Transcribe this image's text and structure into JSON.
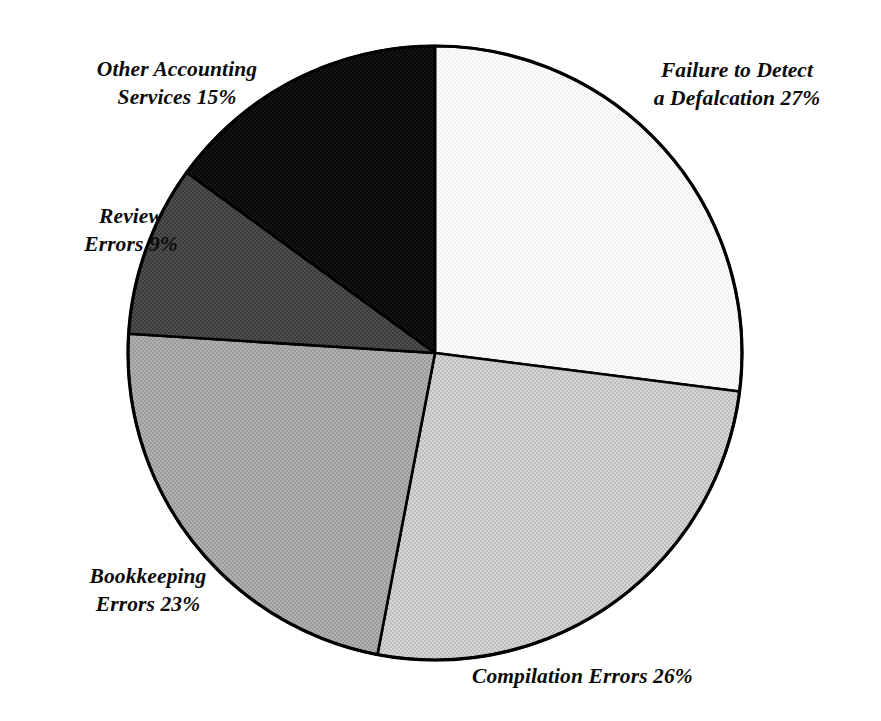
{
  "chart_data": {
    "type": "pie",
    "title": "",
    "subtitle": "",
    "xlabel": "",
    "ylabel": "",
    "legend_position": "none",
    "grid": false,
    "units": "percent",
    "start_angle_deg": 0,
    "direction": "clockwise",
    "center": {
      "x": 435,
      "y": 353
    },
    "radius": 307,
    "categories": [
      "Failure to Detect a Defalcation",
      "Compilation Errors",
      "Bookkeeping Errors",
      "Review Errors",
      "Other Accounting Services"
    ],
    "values": [
      27,
      26,
      23,
      9,
      15
    ],
    "slices": [
      {
        "name": "failure-to-detect-a-defalcation",
        "label_line1": "Failure to Detect",
        "label_line2": "a Defalcation 27%",
        "label_text": "Failure to Detect\na Defalcation 27%",
        "value": 27,
        "value_text": "27%",
        "fill": "#f7f7f7",
        "start_deg": 0,
        "end_deg": 97.2,
        "label_position": "right-top"
      },
      {
        "name": "compilation-errors",
        "label_line1": "Compilation Errors 26%",
        "label_line2": "",
        "label_text": "Compilation Errors 26%",
        "value": 26,
        "value_text": "26%",
        "fill": "#c9c9c9",
        "start_deg": 97.2,
        "end_deg": 190.8,
        "label_position": "bottom-right"
      },
      {
        "name": "bookkeeping-errors",
        "label_line1": "Bookkeeping",
        "label_line2": "Errors 23%",
        "label_text": "Bookkeeping\nErrors 23%",
        "value": 23,
        "value_text": "23%",
        "fill": "#a6a6a6",
        "start_deg": 190.8,
        "end_deg": 273.6,
        "label_position": "bottom-left"
      },
      {
        "name": "review-errors",
        "label_line1": "Review",
        "label_line2": "Errors 9%",
        "label_text": "Review\nErrors 9%",
        "value": 9,
        "value_text": "9%",
        "fill": "#484848",
        "start_deg": 273.6,
        "end_deg": 306.0,
        "label_position": "left"
      },
      {
        "name": "other-accounting-services",
        "label_line1": "Other Accounting",
        "label_line2": "Services 15%",
        "label_text": "Other Accounting\nServices 15%",
        "value": 15,
        "value_text": "15%",
        "fill": "#111111",
        "start_deg": 306.0,
        "end_deg": 360.0,
        "label_position": "left-top"
      }
    ],
    "colors": {
      "outline": "#000000",
      "background": "#ffffff",
      "text": "#0b0b0b"
    }
  }
}
